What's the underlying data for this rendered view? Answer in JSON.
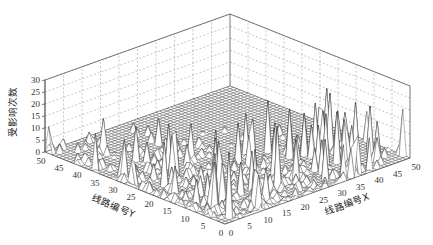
{
  "chart_data": {
    "type": "surface3d",
    "title": "",
    "xlabel": "线路编号X",
    "ylabel": "线路编号Y",
    "zlabel": "受影响次数",
    "xlim": [
      0,
      50
    ],
    "ylim": [
      0,
      50
    ],
    "zlim": [
      0,
      30
    ],
    "x_ticks": [
      0,
      5,
      10,
      15,
      20,
      25,
      30,
      35,
      40,
      45,
      50
    ],
    "y_ticks": [
      0,
      5,
      10,
      15,
      20,
      25,
      30,
      35,
      40,
      45,
      50
    ],
    "z_ticks": [
      0,
      5,
      10,
      15,
      20,
      25,
      30
    ],
    "grid": true,
    "surface_description": "Wireframe mesh surface over a 50x50 grid of line indices; mostly low values (0-5) with many sharp isolated spikes reaching 15-28, denser near low X and low Y, flat zero region toward the back (high X, high Y).",
    "peak_samples": [
      {
        "x": 3,
        "y": 2,
        "z": 27
      },
      {
        "x": 8,
        "y": 10,
        "z": 24
      },
      {
        "x": 12,
        "y": 4,
        "z": 22
      },
      {
        "x": 15,
        "y": 18,
        "z": 20
      },
      {
        "x": 20,
        "y": 6,
        "z": 26
      },
      {
        "x": 5,
        "y": 22,
        "z": 18
      },
      {
        "x": 25,
        "y": 12,
        "z": 19
      },
      {
        "x": 2,
        "y": 30,
        "z": 16
      },
      {
        "x": 30,
        "y": 3,
        "z": 17
      },
      {
        "x": 38,
        "y": 8,
        "z": 21
      },
      {
        "x": 42,
        "y": 14,
        "z": 23
      },
      {
        "x": 45,
        "y": 10,
        "z": 20
      },
      {
        "x": 10,
        "y": 35,
        "z": 14
      },
      {
        "x": 18,
        "y": 28,
        "z": 15
      },
      {
        "x": 33,
        "y": 20,
        "z": 12
      }
    ]
  },
  "axes": {
    "z_label": "受影响次数",
    "y_label": "线路编号Y",
    "x_label": "线路编号X",
    "z_tick_labels": [
      "0",
      "5",
      "10",
      "15",
      "20",
      "25",
      "30"
    ],
    "y_tick_labels": [
      "0",
      "5",
      "10",
      "15",
      "20",
      "25",
      "30",
      "35",
      "40",
      "45",
      "50"
    ],
    "x_tick_labels": [
      "0",
      "5",
      "10",
      "15",
      "20",
      "25",
      "30",
      "35",
      "40",
      "45",
      "50"
    ]
  }
}
